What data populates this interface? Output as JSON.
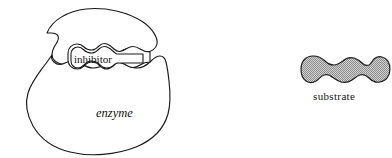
{
  "figure": {
    "background_color": "#ffffff",
    "outline_color": "#1a1a1a",
    "labels": {
      "enzyme": "enzyme",
      "inhibitor": "inhibitor",
      "substrate": "substrate"
    },
    "shapes": {
      "enzyme": {
        "name": "enzyme-body",
        "fill": "#ffffff",
        "stroke": "#1a1a1a",
        "description": "large irregular kidney-shaped blob with a wavy cleft on the right side"
      },
      "active_site": {
        "name": "active-site-cleft",
        "fill": "#ffffff",
        "stroke": "#1a1a1a",
        "description": "wavy lobed channel opening to the right of the enzyme"
      },
      "inhibitor": {
        "name": "inhibitor-molecule",
        "fill": "#ffffff",
        "stroke": "#1a1a1a",
        "description": "wavy three-lobed molecule with a rectangular tail bound in the cleft"
      },
      "substrate": {
        "name": "substrate-molecule",
        "fill": "#a8a8a8",
        "fill_pattern": "halftone-dither",
        "stroke": "#1a1a1a",
        "lobes": 3,
        "description": "grey stippled three-lobed molecule drawn separately at right"
      }
    }
  }
}
